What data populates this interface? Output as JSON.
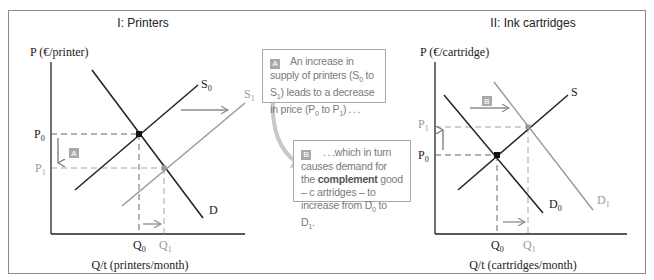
{
  "panels": [
    {
      "title": "I: Printers",
      "y_axis_label": "P (€/printer)",
      "x_axis_label": "Q/t (printers/month)",
      "curves": {
        "demand": "D",
        "supply_initial": "S",
        "supply_initial_sub": "0",
        "supply_new": "S",
        "supply_new_sub": "1"
      },
      "price_labels": {
        "p0": "P",
        "p0_sub": "0",
        "p1": "P",
        "p1_sub": "1"
      },
      "quantity_labels": {
        "q0": "Q",
        "q0_sub": "0",
        "q1": "Q",
        "q1_sub": "1"
      },
      "badge": "A"
    },
    {
      "title": "II: Ink cartridges",
      "y_axis_label": "P (€/cartridge)",
      "x_axis_label": "Q/t (cartridges/month)",
      "curves": {
        "supply": "S",
        "demand_initial": "D",
        "demand_initial_sub": "0",
        "demand_new": "D",
        "demand_new_sub": "1"
      },
      "price_labels": {
        "p0": "P",
        "p0_sub": "0",
        "p1": "P",
        "p1_sub": "1"
      },
      "quantity_labels": {
        "q0": "Q",
        "q0_sub": "0",
        "q1": "Q",
        "q1_sub": "1"
      },
      "badge": "B"
    }
  ],
  "notes": {
    "a": {
      "badge": "A",
      "text_1": "An increase in supply of printers (S",
      "sub_1": "0",
      "text_2": " to S",
      "sub_2": "1",
      "text_3": ") leads to a decrease in price (P",
      "sub_3": "0",
      "text_4": " to P",
      "sub_4": "1",
      "text_5": ") . . ."
    },
    "b": {
      "badge": "B",
      "text_1": " . . .which in turn causes demand for the ",
      "bold": "complement",
      "text_2": " good – c artridges – to increase from D",
      "sub_1": "0",
      "text_3": " to D",
      "sub_2": "1",
      "text_4": "."
    }
  },
  "colors": {
    "primary_line": "#222222",
    "shifted_line": "#9a9a9a",
    "arrow": "#8c8c8c",
    "badge": "#a9a9a9",
    "curved_arrow": "#c8c8c8"
  }
}
